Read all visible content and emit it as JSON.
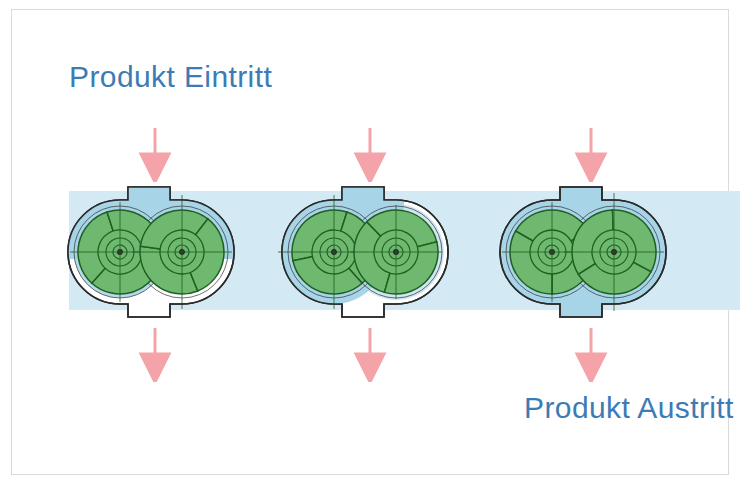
{
  "figure": {
    "title_inlet": "Produkt Eintritt",
    "title_outlet": "Produkt Austritt",
    "stage_count": 3
  },
  "labels": {
    "inlet": "Produkt Eintritt",
    "outlet": "Produkt Austritt"
  },
  "colors": {
    "text_blue": "#3d7bb5",
    "arrow_pink": "#f4a3a8",
    "rotor_green": "#6fb86f",
    "rotor_green_dark": "#4f9c52",
    "product_blue": "#a8d4e8",
    "product_band": "#d3e9f3",
    "housing_outline": "#2b2b2b",
    "frame_border": "#d9dadc",
    "background": "#ffffff"
  },
  "stages": [
    {
      "id": "stage-1",
      "name": "Ansaugen",
      "left_rotor_angle": 12,
      "right_rotor_angle": -52,
      "product_fill": "partial-upper",
      "fill_fraction": 0.35
    },
    {
      "id": "stage-2",
      "name": "Foerdern",
      "left_rotor_angle": 48,
      "right_rotor_angle": -14,
      "product_fill": "partial-left",
      "fill_fraction": 0.6
    },
    {
      "id": "stage-3",
      "name": "Ausstossen",
      "left_rotor_angle": 90,
      "right_rotor_angle": 28,
      "product_fill": "full",
      "fill_fraction": 1.0
    }
  ],
  "arrows": {
    "inlet": [
      {
        "id": "inlet-arrow-1",
        "x": 126,
        "y": 118
      },
      {
        "id": "inlet-arrow-2",
        "x": 341,
        "y": 118
      },
      {
        "id": "inlet-arrow-3",
        "x": 562,
        "y": 118
      }
    ],
    "outlet": [
      {
        "id": "outlet-arrow-1",
        "x": 126,
        "y": 318
      },
      {
        "id": "outlet-arrow-2",
        "x": 341,
        "y": 318
      },
      {
        "id": "outlet-arrow-3",
        "x": 562,
        "y": 318
      }
    ]
  },
  "geometry": {
    "stage_offsets": [
      38,
      252,
      470
    ],
    "rotor_lobes": 3,
    "hub_rings": 3
  }
}
